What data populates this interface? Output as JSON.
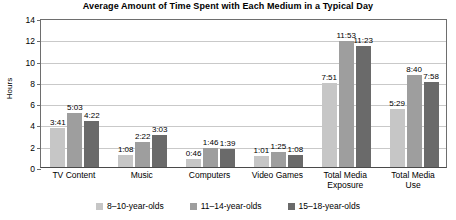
{
  "chart_data": {
    "type": "bar",
    "title": "Average Amount of Time Spent with Each Medium in a Typical Day",
    "xlabel": "",
    "ylabel": "Hours",
    "ylim": [
      0,
      14
    ],
    "ytick_step": 2,
    "yticks": [
      "0",
      "2",
      "4",
      "6",
      "8",
      "10",
      "12",
      "14"
    ],
    "grid": true,
    "legend_position": "bottom",
    "categories": [
      "TV Content",
      "Music",
      "Computers",
      "Video Games",
      "Total Media\nExposure",
      "Total Media\nUse"
    ],
    "series": [
      {
        "name": "8–10-year-olds",
        "color": "#c6c6c6",
        "labels": [
          "3:41",
          "1:08",
          "0:46",
          "1:01",
          "7:51",
          "5:29"
        ],
        "values": [
          3.68,
          1.13,
          0.77,
          1.02,
          7.85,
          5.48
        ]
      },
      {
        "name": "11–14-year-olds",
        "color": "#9e9e9e",
        "labels": [
          "5:03",
          "2:22",
          "1:46",
          "1:25",
          "11:53",
          "8:40"
        ],
        "values": [
          5.05,
          2.37,
          1.77,
          1.42,
          11.88,
          8.67
        ]
      },
      {
        "name": "15–18-year-olds",
        "color": "#6a6a6a",
        "labels": [
          "4:22",
          "3:03",
          "1:39",
          "1:08",
          "11:23",
          "7:58"
        ],
        "values": [
          4.37,
          3.05,
          1.65,
          1.13,
          11.38,
          7.97
        ]
      }
    ]
  }
}
